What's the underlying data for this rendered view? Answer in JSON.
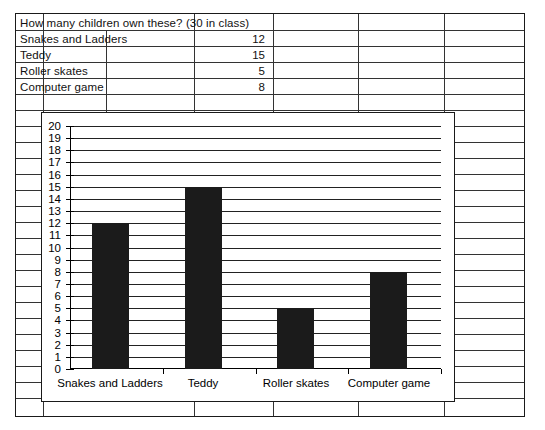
{
  "document": {
    "kind": "worksheet-with-bar-chart"
  },
  "table": {
    "title": "How many children own these? (30 in class)",
    "columns": [
      "Item",
      "",
      "Count",
      "",
      "",
      ""
    ],
    "rows": [
      {
        "label": "Snakes and Ladders",
        "value": "12"
      },
      {
        "label": "Teddy",
        "value": "15"
      },
      {
        "label": "Roller skates",
        "value": "5"
      },
      {
        "label": "Computer game",
        "value": "8"
      }
    ]
  },
  "chart_data": {
    "type": "bar",
    "title": "",
    "subtitle": "",
    "categories": [
      "Snakes and Ladders",
      "Teddy",
      "Roller skates",
      "Computer game"
    ],
    "values": [
      12,
      15,
      5,
      8
    ],
    "xlabel": "",
    "ylabel": "",
    "ylim": [
      0,
      20
    ],
    "ytick_step": 1,
    "yticks": [
      "0",
      "1",
      "2",
      "3",
      "4",
      "5",
      "6",
      "7",
      "8",
      "9",
      "10",
      "11",
      "12",
      "13",
      "14",
      "15",
      "16",
      "17",
      "18",
      "19",
      "20"
    ],
    "grid": "horizontal",
    "legend": "none",
    "bar_color": "#1b1b1b",
    "axis_color": "#000000"
  }
}
